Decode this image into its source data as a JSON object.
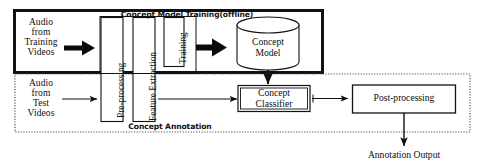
{
  "diagram": {
    "sections": {
      "training": {
        "caption": "Concept Model Training(offline)",
        "border_color": "#000000",
        "border_style": "solid"
      },
      "annotation": {
        "caption": "Concept Annotation",
        "border_color": "#555555",
        "border_style": "dotted"
      }
    },
    "inputs": {
      "training_source": "Audio\nfrom\nTraining\nVideos",
      "test_source": "Audio\nfrom\nTest\nVideos"
    },
    "stages": {
      "preprocessing": "Pre-processing",
      "feature_extraction": "Feature Extraction",
      "training": "Training"
    },
    "blocks": {
      "concept_model": "Concept\nModel",
      "concept_classifier": "Concept\nClassifier",
      "post_processing": "Post-processing"
    },
    "output": "Annotation Output",
    "icons": {
      "bold_arrow": "thick-right-arrow-icon",
      "thin_arrow": "thin-right-arrow-icon",
      "down_arrow": "down-arrow-icon",
      "cylinder": "database-cylinder-icon"
    },
    "colors": {
      "stroke": "#111111",
      "fill": "#ffffff",
      "dotted": "#666666",
      "text": "#0d0d0d"
    }
  }
}
